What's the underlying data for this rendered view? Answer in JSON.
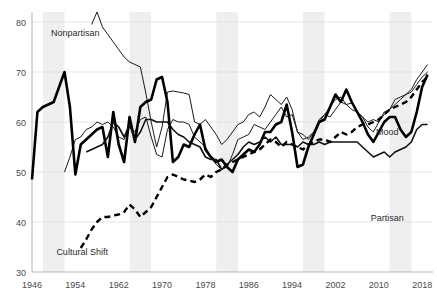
{
  "chart_data": {
    "type": "line",
    "title": "",
    "subtitle": "",
    "xlabel": "",
    "ylabel": "",
    "xlim": [
      1946,
      2020
    ],
    "ylim": [
      30,
      82
    ],
    "grid": true,
    "legend_position": "inline-annotations",
    "y_ticks": [
      "30",
      "40",
      "50",
      "60",
      "70",
      "80"
    ],
    "y_tick_values": [
      30,
      40,
      50,
      60,
      70,
      80
    ],
    "x_ticks": [
      "1946",
      "1954",
      "1962",
      "1970",
      "1978",
      "1986",
      "1994",
      "2002",
      "2010",
      "2018"
    ],
    "x_tick_values": [
      1946,
      1954,
      1962,
      1970,
      1978,
      1986,
      1994,
      2002,
      2010,
      2018
    ],
    "shaded_bands": [
      {
        "start": 1948,
        "end": 1952
      },
      {
        "start": 1964,
        "end": 1968
      },
      {
        "start": 1980,
        "end": 1984
      },
      {
        "start": 1996,
        "end": 2000
      },
      {
        "start": 2012,
        "end": 2016
      }
    ],
    "shaded_band_color": "#efefef",
    "annotations": [
      {
        "text": "Nonpartisan",
        "x": 1949.5,
        "y": 77.2
      },
      {
        "text": "Cultural Shift",
        "x": 1950.5,
        "y": 33.5
      },
      {
        "text": "Mood",
        "x": 2009.5,
        "y": 57.5
      },
      {
        "text": "Partisan",
        "x": 2008.5,
        "y": 40.2
      }
    ],
    "series": [
      {
        "name": "Nonpartisan",
        "style": "thin-solid",
        "color": "#1a1a1a",
        "width": 1,
        "x": [
          1957,
          1958,
          1959,
          1960,
          1961,
          1962,
          1963,
          1964,
          1965,
          1966,
          1967,
          1968,
          1969,
          1970,
          1971,
          1972,
          1973,
          1974,
          1975,
          1976,
          1977,
          1978,
          1979,
          1980,
          1981,
          1982,
          1983,
          1984,
          1985,
          1986,
          1987,
          1988,
          1989,
          1990,
          1991,
          1992,
          1993,
          1994,
          1995,
          1996,
          1997,
          1998,
          1999,
          2000,
          2001,
          2002,
          2003,
          2004,
          2005,
          2006,
          2007,
          2008,
          2009,
          2010,
          2011,
          2012,
          2013,
          2014,
          2015,
          2016,
          2017,
          2018,
          2019
        ],
        "values": [
          79.5,
          82.0,
          79.0,
          77.5,
          76.0,
          74.5,
          73.0,
          72.0,
          71.5,
          71.0,
          65.8,
          60.0,
          55.0,
          59.0,
          66.0,
          66.2,
          66.0,
          65.8,
          65.5,
          60.0,
          59.5,
          60.5,
          59.0,
          57.5,
          55.5,
          56.5,
          58.0,
          59.5,
          60.0,
          61.5,
          62.0,
          61.0,
          63.0,
          65.5,
          64.5,
          63.5,
          65.0,
          62.5,
          58.0,
          56.5,
          57.0,
          58.0,
          60.5,
          61.5,
          63.0,
          64.5,
          65.0,
          63.5,
          63.8,
          62.0,
          61.0,
          60.0,
          60.5,
          60.0,
          61.5,
          62.5,
          64.5,
          65.0,
          65.5,
          66.5,
          68.5,
          70.0,
          71.5
        ]
      },
      {
        "name": "Mood",
        "style": "thin-solid",
        "color": "#1a1a1a",
        "width": 1,
        "x": [
          1952,
          1953,
          1954,
          1955,
          1956,
          1957,
          1958,
          1959,
          1960,
          1961,
          1962,
          1963,
          1964,
          1965,
          1966,
          1967,
          1968,
          1969,
          1970,
          1971,
          1972,
          1973,
          1974,
          1975,
          1976,
          1977,
          1978,
          1979,
          1980,
          1981,
          1982,
          1983,
          1984,
          1985,
          1986,
          1987,
          1988,
          1989,
          1990,
          1991,
          1992,
          1993,
          1994,
          1995,
          1996,
          1997,
          1998,
          1999,
          2000,
          2001,
          2002,
          2003,
          2004,
          2005,
          2006,
          2007,
          2008,
          2009,
          2010,
          2011,
          2012,
          2013,
          2014,
          2015,
          2016,
          2017,
          2018,
          2019
        ],
        "values": [
          50.0,
          53.0,
          56.5,
          57.0,
          58.5,
          59.0,
          60.0,
          59.5,
          60.0,
          59.0,
          57.0,
          56.5,
          59.0,
          58.0,
          60.5,
          61.0,
          57.0,
          53.5,
          53.0,
          58.5,
          60.5,
          60.0,
          60.0,
          59.5,
          57.0,
          56.0,
          55.0,
          53.0,
          51.5,
          50.5,
          51.0,
          53.5,
          56.5,
          57.0,
          57.5,
          59.5,
          59.0,
          58.5,
          60.0,
          61.5,
          63.0,
          61.0,
          61.5,
          58.0,
          57.5,
          56.5,
          58.0,
          60.0,
          61.5,
          61.0,
          62.5,
          64.0,
          63.5,
          62.5,
          62.0,
          61.0,
          59.0,
          58.0,
          60.0,
          62.0,
          62.5,
          63.5,
          64.5,
          65.5,
          66.0,
          67.5,
          69.0,
          70.0
        ]
      },
      {
        "name": "Partisan-thick",
        "style": "thick-solid",
        "color": "#000000",
        "width": 2.6,
        "x": [
          1946,
          1947,
          1948,
          1949,
          1950,
          1951,
          1952,
          1953,
          1954,
          1955,
          1956,
          1957,
          1958,
          1959,
          1960,
          1961,
          1962,
          1963,
          1964,
          1965,
          1966,
          1967,
          1968,
          1969,
          1970,
          1971,
          1972,
          1973,
          1974,
          1975,
          1976,
          1977,
          1978,
          1979,
          1980,
          1981,
          1982,
          1983,
          1984,
          1985,
          1986,
          1987,
          1988,
          1989,
          1990,
          1991,
          1992,
          1993,
          1994,
          1995,
          1996,
          1997,
          1998,
          1999,
          2000,
          2001,
          2002,
          2003,
          2004,
          2005,
          2006,
          2007,
          2008,
          2009,
          2010,
          2011,
          2012,
          2013,
          2014,
          2015,
          2016,
          2017,
          2018,
          2019
        ],
        "values": [
          48.5,
          62.0,
          63.0,
          63.5,
          64.0,
          67.0,
          70.0,
          63.0,
          49.5,
          55.5,
          56.5,
          57.5,
          58.5,
          59.0,
          53.0,
          62.0,
          55.5,
          52.0,
          61.0,
          56.0,
          63.0,
          64.0,
          64.5,
          68.5,
          69.0,
          64.0,
          52.0,
          53.0,
          55.5,
          55.0,
          57.5,
          59.5,
          54.5,
          53.0,
          52.0,
          52.5,
          51.0,
          50.0,
          52.5,
          53.5,
          54.5,
          54.0,
          55.5,
          58.0,
          58.0,
          59.5,
          60.0,
          63.5,
          58.0,
          51.0,
          51.5,
          55.0,
          57.5,
          60.0,
          60.5,
          63.0,
          65.5,
          64.0,
          66.5,
          64.0,
          62.0,
          60.0,
          57.5,
          56.0,
          58.0,
          60.0,
          61.0,
          61.0,
          58.5,
          57.0,
          58.0,
          62.0,
          67.0,
          69.5
        ]
      },
      {
        "name": "Partisan",
        "style": "medium-solid",
        "color": "#111111",
        "width": 1.6,
        "x": [
          1956,
          1957,
          1958,
          1959,
          1960,
          1961,
          1962,
          1963,
          1964,
          1965,
          1966,
          1967,
          1968,
          1969,
          1970,
          1971,
          1972,
          1973,
          1974,
          1975,
          1976,
          1977,
          1978,
          1979,
          1980,
          1981,
          1982,
          1983,
          1984,
          1985,
          1986,
          1987,
          1988,
          1989,
          1990,
          1991,
          1992,
          1993,
          1994,
          1995,
          1996,
          1997,
          1998,
          1999,
          2000,
          2001,
          2002,
          2003,
          2004,
          2005,
          2006,
          2007,
          2008,
          2009,
          2010,
          2011,
          2012,
          2013,
          2014,
          2015,
          2016,
          2017,
          2018,
          2019
        ],
        "values": [
          54.0,
          54.5,
          55.0,
          55.5,
          57.0,
          60.0,
          59.0,
          57.0,
          59.5,
          56.5,
          58.0,
          60.5,
          60.5,
          60.0,
          60.0,
          60.0,
          58.5,
          57.5,
          57.0,
          56.0,
          55.5,
          55.0,
          53.0,
          52.5,
          52.5,
          50.5,
          51.5,
          52.5,
          53.5,
          55.0,
          56.0,
          55.5,
          56.0,
          57.0,
          56.0,
          57.0,
          55.5,
          55.5,
          55.5,
          55.0,
          56.0,
          55.5,
          55.5,
          56.0,
          55.5,
          56.0,
          56.0,
          56.0,
          56.0,
          56.0,
          56.0,
          55.0,
          54.0,
          53.0,
          53.5,
          54.0,
          53.0,
          54.0,
          54.5,
          55.0,
          56.0,
          58.5,
          59.5,
          59.5
        ]
      },
      {
        "name": "Cultural Shift",
        "style": "dashed",
        "color": "#000000",
        "width": 2.4,
        "x": [
          1955,
          1956,
          1957,
          1958,
          1959,
          1960,
          1961,
          1962,
          1963,
          1964,
          1965,
          1966,
          1967,
          1968,
          1969,
          1970,
          1971,
          1972,
          1973,
          1974,
          1975,
          1976,
          1977,
          1978,
          1979,
          1980,
          1981,
          1982,
          1983,
          1984,
          1985,
          1986,
          1987,
          1988,
          1989,
          1990,
          1991,
          1992,
          1993,
          1994,
          1995,
          1996,
          1997,
          1998,
          1999,
          2000,
          2001,
          2002,
          2003,
          2004,
          2005,
          2006,
          2007,
          2008,
          2009,
          2010,
          2011,
          2012,
          2013,
          2014,
          2015,
          2016,
          2017,
          2018,
          2019
        ],
        "values": [
          34.8,
          36.5,
          38.5,
          40.0,
          41.0,
          41.0,
          41.3,
          41.5,
          42.0,
          43.5,
          42.5,
          41.0,
          42.0,
          43.0,
          45.0,
          47.0,
          49.0,
          49.5,
          49.0,
          48.5,
          48.3,
          48.0,
          48.5,
          49.5,
          49.0,
          50.0,
          50.5,
          51.5,
          52.0,
          52.5,
          53.0,
          53.5,
          54.0,
          54.5,
          55.5,
          56.5,
          56.0,
          55.0,
          56.0,
          55.5,
          55.0,
          54.5,
          55.5,
          56.0,
          56.5,
          56.5,
          56.0,
          57.0,
          58.0,
          57.5,
          58.0,
          59.0,
          59.5,
          59.5,
          60.0,
          60.5,
          61.5,
          62.5,
          63.0,
          63.5,
          64.0,
          65.0,
          66.5,
          68.0,
          69.0
        ]
      }
    ]
  }
}
